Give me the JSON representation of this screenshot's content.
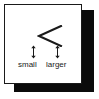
{
  "figure": {
    "name": "less-than-symbol-explainer",
    "card": {
      "background_color": "#ffffff",
      "border_color": "#1a1a1a",
      "shadow_color": "#0b0b0b"
    },
    "symbol": {
      "glyph": "<",
      "semantic_name": "less-than-icon",
      "color": "#1a1a1a"
    },
    "markers": [
      {
        "id": "small",
        "icon": "up-down-arrow-icon"
      },
      {
        "id": "larger",
        "icon": "up-down-arrow-icon"
      }
    ],
    "labels": {
      "left": "small",
      "right": "larger"
    }
  }
}
